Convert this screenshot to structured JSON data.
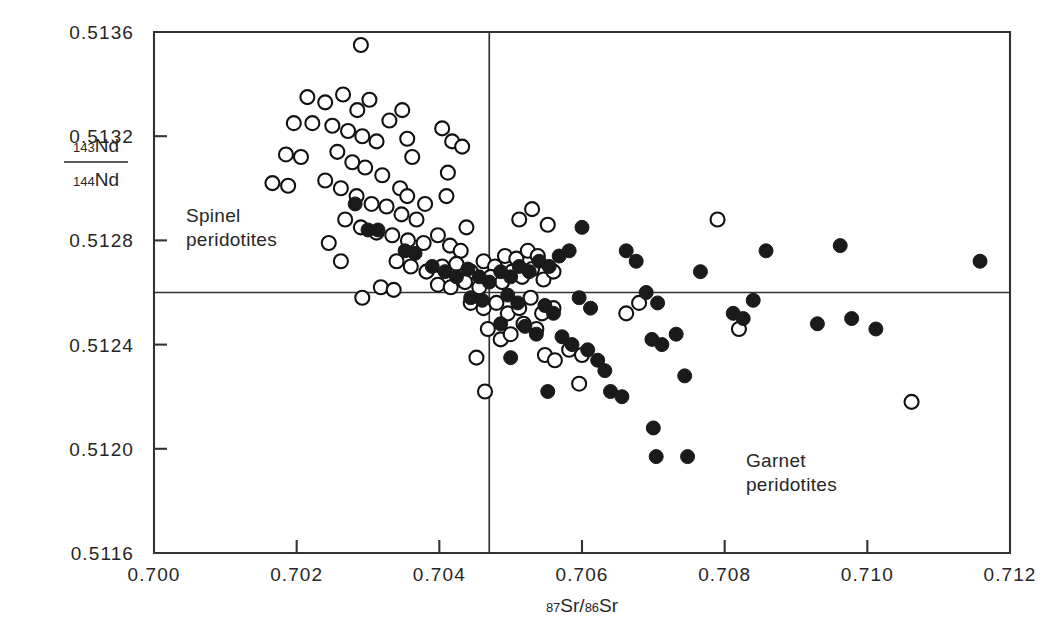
{
  "figure": {
    "background_color": "#ffffff",
    "ink_color": "#1a1a1a",
    "open_marker_fill": "#ffffff",
    "filled_marker_fill": "#1a1a1a"
  },
  "annotations": {
    "spinel_line1": "Spinel",
    "spinel_line2": "peridotites",
    "garnet_line1": "Garnet",
    "garnet_line2": "peridotites"
  },
  "axis_label": {
    "y_numer_sup": "143",
    "y_numer_base": "Nd",
    "y_denom_sup": "144",
    "y_denom_base": "Nd",
    "x_sup1": "87",
    "x_base1": "Sr",
    "x_slash": "/",
    "x_sup2": "86",
    "x_base2": "Sr"
  },
  "chart_data": {
    "type": "scatter",
    "title": "",
    "xlabel": "87Sr/86Sr",
    "ylabel": "143Nd/144Nd",
    "xlim": [
      0.7,
      0.712
    ],
    "ylim": [
      0.5116,
      0.5136
    ],
    "xticks": [
      0.7,
      0.702,
      0.704,
      0.706,
      0.708,
      0.71,
      0.712
    ],
    "xticklabels": [
      "0.700",
      "0.702",
      "0.704",
      "0.706",
      "0.708",
      "0.710",
      "0.712"
    ],
    "yticks": [
      0.5116,
      0.512,
      0.5124,
      0.5128,
      0.5132,
      0.5136
    ],
    "yticklabels": [
      "0.5116",
      "0.5120",
      "0.5124",
      "0.5128",
      "0.5132",
      "0.5136"
    ],
    "grid": false,
    "legend": null,
    "reference_lines": [
      {
        "orientation": "horizontal",
        "value": 0.5126,
        "label": "bulk-earth Nd"
      },
      {
        "orientation": "vertical",
        "value": 0.7047,
        "label": "bulk-earth Sr"
      }
    ],
    "marker_radius_px": 7,
    "series": [
      {
        "name": "Spinel peridotites",
        "marker": "open-circle",
        "points": [
          [
            0.7029,
            0.51355
          ],
          [
            0.70215,
            0.51335
          ],
          [
            0.7024,
            0.51333
          ],
          [
            0.70265,
            0.51336
          ],
          [
            0.70285,
            0.5133
          ],
          [
            0.70302,
            0.51334
          ],
          [
            0.70196,
            0.51325
          ],
          [
            0.70222,
            0.51325
          ],
          [
            0.7025,
            0.51324
          ],
          [
            0.70272,
            0.51322
          ],
          [
            0.70292,
            0.5132
          ],
          [
            0.70312,
            0.51318
          ],
          [
            0.7033,
            0.51326
          ],
          [
            0.70348,
            0.5133
          ],
          [
            0.70355,
            0.51319
          ],
          [
            0.70185,
            0.51313
          ],
          [
            0.70206,
            0.51312
          ],
          [
            0.70257,
            0.51314
          ],
          [
            0.70278,
            0.5131
          ],
          [
            0.70296,
            0.51308
          ],
          [
            0.7032,
            0.51305
          ],
          [
            0.70345,
            0.513
          ],
          [
            0.70362,
            0.51312
          ],
          [
            0.70166,
            0.51302
          ],
          [
            0.70188,
            0.51301
          ],
          [
            0.7024,
            0.51303
          ],
          [
            0.70262,
            0.513
          ],
          [
            0.70284,
            0.51297
          ],
          [
            0.70305,
            0.51294
          ],
          [
            0.70326,
            0.51293
          ],
          [
            0.70347,
            0.5129
          ],
          [
            0.70368,
            0.51288
          ],
          [
            0.70355,
            0.51297
          ],
          [
            0.7038,
            0.51294
          ],
          [
            0.70268,
            0.51288
          ],
          [
            0.7029,
            0.51285
          ],
          [
            0.70312,
            0.51283
          ],
          [
            0.70334,
            0.51282
          ],
          [
            0.70356,
            0.5128
          ],
          [
            0.70378,
            0.51279
          ],
          [
            0.70398,
            0.51282
          ],
          [
            0.70415,
            0.51278
          ],
          [
            0.7043,
            0.51276
          ],
          [
            0.70245,
            0.51279
          ],
          [
            0.70262,
            0.51272
          ],
          [
            0.7034,
            0.51272
          ],
          [
            0.7036,
            0.5127
          ],
          [
            0.70382,
            0.51268
          ],
          [
            0.70404,
            0.5127
          ],
          [
            0.70424,
            0.51271
          ],
          [
            0.70444,
            0.51268
          ],
          [
            0.70462,
            0.51272
          ],
          [
            0.70478,
            0.5127
          ],
          [
            0.70492,
            0.51274
          ],
          [
            0.70508,
            0.51273
          ],
          [
            0.70524,
            0.51276
          ],
          [
            0.70538,
            0.51274
          ],
          [
            0.70398,
            0.51263
          ],
          [
            0.70416,
            0.51262
          ],
          [
            0.70436,
            0.51264
          ],
          [
            0.70456,
            0.51262
          ],
          [
            0.70472,
            0.51266
          ],
          [
            0.70488,
            0.51264
          ],
          [
            0.70502,
            0.51268
          ],
          [
            0.70516,
            0.51266
          ],
          [
            0.7053,
            0.51269
          ],
          [
            0.70546,
            0.51265
          ],
          [
            0.7056,
            0.51268
          ],
          [
            0.70318,
            0.51262
          ],
          [
            0.70336,
            0.51261
          ],
          [
            0.70444,
            0.51256
          ],
          [
            0.70462,
            0.51254
          ],
          [
            0.7048,
            0.51256
          ],
          [
            0.70496,
            0.51252
          ],
          [
            0.70512,
            0.51254
          ],
          [
            0.70528,
            0.51258
          ],
          [
            0.70544,
            0.51252
          ],
          [
            0.7056,
            0.51254
          ],
          [
            0.70292,
            0.51258
          ],
          [
            0.70468,
            0.51246
          ],
          [
            0.70486,
            0.51242
          ],
          [
            0.705,
            0.51244
          ],
          [
            0.70518,
            0.51248
          ],
          [
            0.70536,
            0.51246
          ],
          [
            0.70452,
            0.51235
          ],
          [
            0.70548,
            0.51236
          ],
          [
            0.70562,
            0.51234
          ],
          [
            0.70582,
            0.51238
          ],
          [
            0.706,
            0.51236
          ],
          [
            0.70404,
            0.51323
          ],
          [
            0.70418,
            0.51318
          ],
          [
            0.70432,
            0.51316
          ],
          [
            0.70412,
            0.51306
          ],
          [
            0.7041,
            0.51297
          ],
          [
            0.70438,
            0.51285
          ],
          [
            0.70512,
            0.51288
          ],
          [
            0.7053,
            0.51292
          ],
          [
            0.70552,
            0.51286
          ],
          [
            0.70464,
            0.51222
          ],
          [
            0.70596,
            0.51225
          ],
          [
            0.7082,
            0.51246
          ],
          [
            0.7079,
            0.51288
          ],
          [
            0.71062,
            0.51218
          ],
          [
            0.70662,
            0.51252
          ],
          [
            0.7068,
            0.51256
          ]
        ]
      },
      {
        "name": "Garnet peridotites",
        "marker": "filled-circle",
        "points": [
          [
            0.70282,
            0.51294
          ],
          [
            0.703,
            0.51284
          ],
          [
            0.70314,
            0.51284
          ],
          [
            0.70352,
            0.51276
          ],
          [
            0.70366,
            0.51275
          ],
          [
            0.7039,
            0.5127
          ],
          [
            0.70408,
            0.51268
          ],
          [
            0.70424,
            0.51266
          ],
          [
            0.7044,
            0.51269
          ],
          [
            0.70456,
            0.51266
          ],
          [
            0.7047,
            0.51264
          ],
          [
            0.70486,
            0.51268
          ],
          [
            0.705,
            0.51266
          ],
          [
            0.70512,
            0.5127
          ],
          [
            0.70526,
            0.51268
          ],
          [
            0.7054,
            0.51272
          ],
          [
            0.70554,
            0.5127
          ],
          [
            0.70568,
            0.51274
          ],
          [
            0.70582,
            0.51276
          ],
          [
            0.70444,
            0.51258
          ],
          [
            0.7046,
            0.51257
          ],
          [
            0.70496,
            0.51259
          ],
          [
            0.7051,
            0.51256
          ],
          [
            0.7052,
            0.51247
          ],
          [
            0.70536,
            0.51244
          ],
          [
            0.70548,
            0.51255
          ],
          [
            0.7056,
            0.51252
          ],
          [
            0.70572,
            0.51243
          ],
          [
            0.70586,
            0.5124
          ],
          [
            0.706,
            0.51285
          ],
          [
            0.70596,
            0.51258
          ],
          [
            0.70612,
            0.51254
          ],
          [
            0.70608,
            0.51238
          ],
          [
            0.70622,
            0.51234
          ],
          [
            0.70632,
            0.5123
          ],
          [
            0.7064,
            0.51222
          ],
          [
            0.70656,
            0.5122
          ],
          [
            0.70662,
            0.51276
          ],
          [
            0.70676,
            0.51272
          ],
          [
            0.7069,
            0.5126
          ],
          [
            0.70706,
            0.51256
          ],
          [
            0.70698,
            0.51242
          ],
          [
            0.70712,
            0.5124
          ],
          [
            0.707,
            0.51208
          ],
          [
            0.70704,
            0.51197
          ],
          [
            0.70748,
            0.51197
          ],
          [
            0.70732,
            0.51244
          ],
          [
            0.70744,
            0.51228
          ],
          [
            0.70766,
            0.51268
          ],
          [
            0.70812,
            0.51252
          ],
          [
            0.70826,
            0.5125
          ],
          [
            0.7084,
            0.51257
          ],
          [
            0.70858,
            0.51276
          ],
          [
            0.7093,
            0.51248
          ],
          [
            0.70962,
            0.51278
          ],
          [
            0.70978,
            0.5125
          ],
          [
            0.71012,
            0.51246
          ],
          [
            0.71158,
            0.51272
          ],
          [
            0.705,
            0.51235
          ],
          [
            0.70552,
            0.51222
          ],
          [
            0.70486,
            0.51248
          ]
        ]
      }
    ]
  }
}
